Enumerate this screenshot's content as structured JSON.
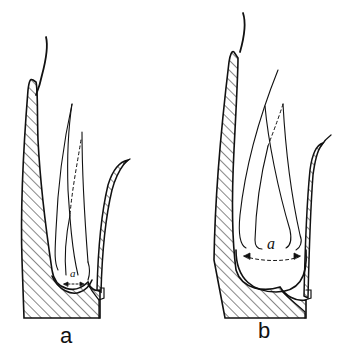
{
  "figure": {
    "panels": [
      {
        "id": "a",
        "label": "a",
        "dimension_label": "a"
      },
      {
        "id": "b",
        "label": "b",
        "dimension_label": "a"
      }
    ],
    "colors": {
      "ink": "#111111",
      "background": "#ffffff"
    }
  }
}
